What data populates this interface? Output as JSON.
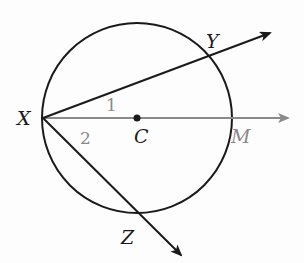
{
  "diagram": {
    "type": "circle-geometry",
    "circle": {
      "center_label": "C",
      "cx": 137,
      "cy": 118,
      "r": 95
    },
    "points": {
      "X": {
        "label": "X",
        "x": 43,
        "y": 118
      },
      "Y": {
        "label": "Y",
        "x": 209,
        "y": 56
      },
      "Z": {
        "label": "Z",
        "x": 141,
        "y": 214
      },
      "M": {
        "label": "M",
        "x": 232,
        "y": 118
      },
      "C": {
        "label": "C",
        "x": 137,
        "y": 118
      }
    },
    "rays": [
      {
        "name": "XY",
        "from": "X",
        "through": "Y",
        "color": "#1a1a1a"
      },
      {
        "name": "XM",
        "from": "X",
        "through": "M",
        "color": "#8a8a8a"
      },
      {
        "name": "XZ",
        "from": "X",
        "through": "Z",
        "color": "#1a1a1a"
      }
    ],
    "angles": [
      {
        "label": "1",
        "between": [
          "XY",
          "XM"
        ],
        "color": "#8a8a8a"
      },
      {
        "label": "2",
        "between": [
          "XM",
          "XZ"
        ],
        "color": "#8a8a8a"
      }
    ]
  }
}
